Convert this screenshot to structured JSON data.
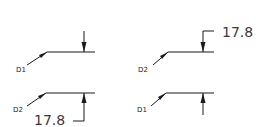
{
  "diagram": {
    "panels": [
      {
        "id": "top-left",
        "leader_label": "D1",
        "dimension_value": "",
        "arrow_direction": "down"
      },
      {
        "id": "top-right",
        "leader_label": "D2",
        "dimension_value": "17.8",
        "arrow_direction": "down"
      },
      {
        "id": "bottom-left",
        "leader_label": "D2",
        "dimension_value": "17.8",
        "arrow_direction": "up"
      },
      {
        "id": "bottom-right",
        "leader_label": "D1",
        "dimension_value": "",
        "arrow_direction": "up"
      }
    ],
    "colors": {
      "line": "#1a1a1a",
      "text": "#3a3a3a",
      "background": "#ffffff"
    }
  }
}
